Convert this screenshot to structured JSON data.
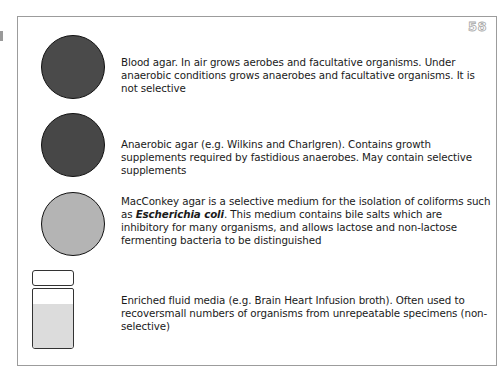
{
  "page": {
    "number": "58"
  },
  "colors": {
    "blood_agar": "#4a4a4a",
    "anaerobic_agar": "#474747",
    "macconkey_agar": "#b4b4b4",
    "broth": "#dcdcdc"
  },
  "entries": [
    {
      "icon": "blood-agar-plate",
      "text": "Blood agar. In air grows aerobes and facultative organisms. Under anaerobic conditions grows anaerobes and facultative organisms. It is not selective"
    },
    {
      "icon": "anaerobic-agar-plate",
      "text": "Anaerobic agar (e.g. Wilkins and Charlgren). Contains growth supplements required by fastidious anaerobes. May contain selective supplements"
    },
    {
      "icon": "macconkey-agar-plate",
      "text_before": "MacConkey agar is a selective medium for the isolation of coliforms such as ",
      "text_emphasis": "Escherichia coli",
      "text_after": ". This medium contains bile salts which are inhibitory for many organisms, and allows lactose and non-lactose fermenting bacteria to be distinguished"
    },
    {
      "icon": "broth-bottle",
      "text": "Enriched fluid media (e.g. Brain Heart Infusion broth). Often used to recoversmall numbers of organisms from unrepeatable specimens (non-selective)"
    }
  ]
}
